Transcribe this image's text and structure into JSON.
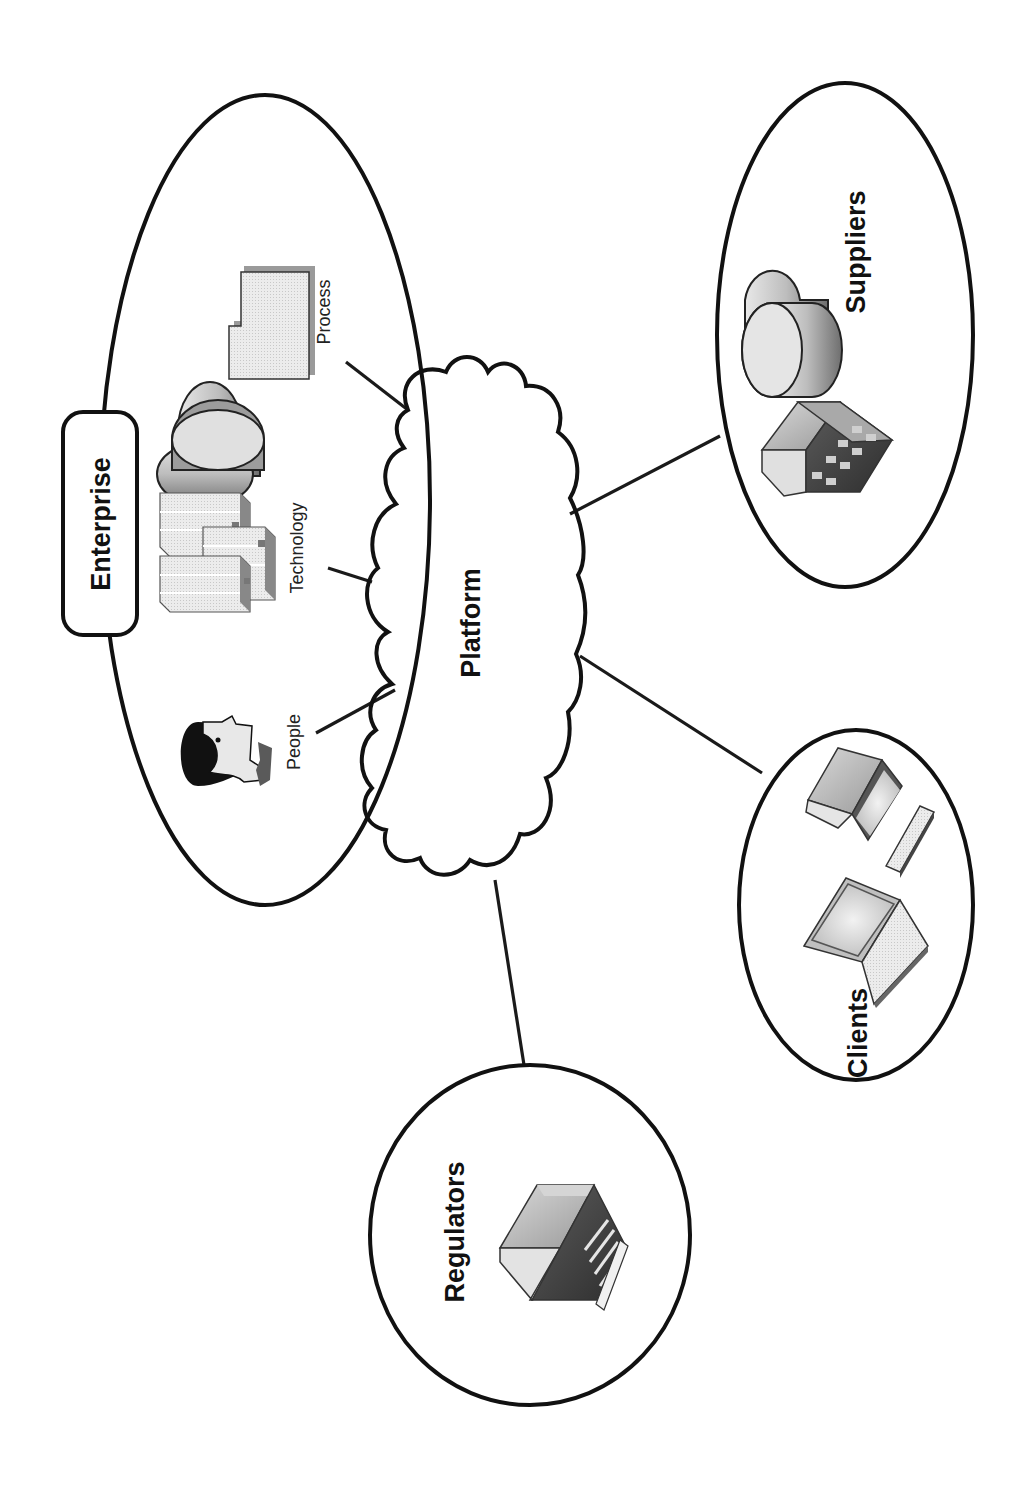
{
  "diagram": {
    "orientation": "rotated-90-ccw",
    "central_node": {
      "label": "Platform",
      "shape": "cloud"
    },
    "enterprise": {
      "label": "Enterprise",
      "shape": "ellipse",
      "components": [
        {
          "label": "Process",
          "icon": "document-icon"
        },
        {
          "label": "Technology",
          "icon": "server-database-icon"
        },
        {
          "label": "People",
          "icon": "person-head-icon"
        }
      ]
    },
    "external_nodes": [
      {
        "label": "Suppliers",
        "shape": "ellipse",
        "icons": [
          "database-icon",
          "building-icon"
        ]
      },
      {
        "label": "Clients",
        "shape": "ellipse",
        "icons": [
          "desktop-computer-icon",
          "keyboard-icon",
          "laptop-icon"
        ]
      },
      {
        "label": "Regulators",
        "shape": "ellipse",
        "icons": [
          "government-building-icon"
        ]
      }
    ],
    "connections": [
      {
        "from": "Process",
        "to": "Platform"
      },
      {
        "from": "Technology",
        "to": "Platform"
      },
      {
        "from": "People",
        "to": "Platform"
      },
      {
        "from": "Platform",
        "to": "Suppliers"
      },
      {
        "from": "Platform",
        "to": "Clients"
      },
      {
        "from": "Platform",
        "to": "Regulators"
      }
    ],
    "colors": {
      "stroke": "#111111",
      "background": "#ffffff",
      "icon_light": "#e6e6e6",
      "icon_mid": "#b5b5b5",
      "icon_dark": "#5a5a5a"
    }
  }
}
